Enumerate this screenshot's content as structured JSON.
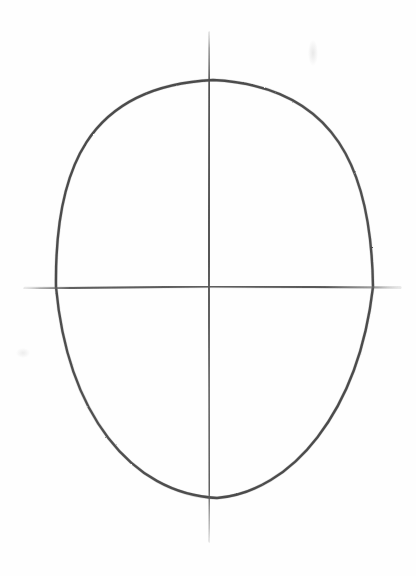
{
  "page": {
    "medium": "graphite pencil on white paper",
    "background_color": "#fefefe",
    "width": 416,
    "height": 576
  },
  "drawing": {
    "subject": "head-construction-oval",
    "description": "Pencil sketch of an egg-shaped head outline crossed by a vertical centerline and a horizontal eye line",
    "stroke_color_outline": "#3c3c3c",
    "stroke_color_guideline": "#4c4c4c",
    "elements": [
      {
        "name": "head-oval",
        "label": "Head oval outline",
        "left_x": 56,
        "right_x": 373,
        "top_y": 80,
        "bottom_y": 498,
        "center_x": 213,
        "center_y": 287,
        "width": 317,
        "height": 418,
        "stroke_width": 2.4
      },
      {
        "name": "vertical-centerline",
        "label": "Vertical centerline",
        "x": 209,
        "top_y": 33,
        "bottom_y": 541,
        "stroke_width": 2.1
      },
      {
        "name": "horizontal-eyeline",
        "label": "Horizontal eye line",
        "y": 287,
        "left_x": 25,
        "right_x": 400,
        "stroke_width": 2.0
      }
    ],
    "marks": [
      {
        "name": "smudge-top-right",
        "x": 313,
        "y": 53
      },
      {
        "name": "smudge-left-low",
        "x": 23,
        "y": 353
      }
    ]
  }
}
